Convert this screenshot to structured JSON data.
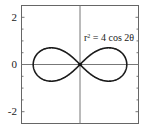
{
  "chart_data": {
    "type": "line",
    "title": "",
    "annotation": "r² = 4 cos 2θ",
    "annotation_parts": {
      "r": "r",
      "exp": "2",
      "rest": " = 4 cos 2θ"
    },
    "curve": "lemniscate r^2 = 4 cos(2θ)",
    "xlabel": "",
    "ylabel": "",
    "xlim": [
      -2.5,
      2.5
    ],
    "ylim": [
      -2.5,
      2.5
    ],
    "yticks": [
      -2,
      0,
      2
    ],
    "ytick_labels": [
      "-2",
      "0",
      "2"
    ],
    "xticks": [],
    "grid": false,
    "axes_lines": {
      "x_axis_at": 0,
      "y_axis_at": 0
    },
    "series": [
      {
        "name": "r^2 = 4 cos 2θ",
        "x_extent": [
          -2,
          2
        ],
        "y_extent": [
          -0.71,
          0.71
        ],
        "points_sample": [
          {
            "x": 2.0,
            "y": 0.0
          },
          {
            "x": 1.5,
            "y": 0.68
          },
          {
            "x": 1.22,
            "y": 0.71
          },
          {
            "x": 0.7,
            "y": 0.55
          },
          {
            "x": 0.0,
            "y": 0.0
          },
          {
            "x": -0.7,
            "y": -0.55
          },
          {
            "x": -1.22,
            "y": -0.71
          },
          {
            "x": -2.0,
            "y": 0.0
          }
        ]
      }
    ],
    "colors": {
      "curve": "#1a1a1a",
      "axes": "#777777",
      "frame": "#666666"
    }
  }
}
